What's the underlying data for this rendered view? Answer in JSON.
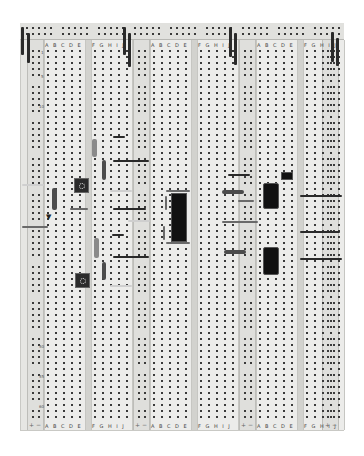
{
  "scene": {
    "description": "Photograph of a solderless breadboard (three terminal-strip sections with power rails) populated with components",
    "colors": {
      "board": "#e6e6e3",
      "hole": "#3a3a3a",
      "wire_dark": "#2a2a2a",
      "wire_light": "#cfcfcf",
      "chip": "#111111"
    }
  },
  "sections": [
    {
      "left_strip_label": "A B C D E",
      "right_strip_label": "F G H I J"
    },
    {
      "left_strip_label": "A B C D E",
      "right_strip_label": "F G H I J"
    },
    {
      "left_strip_label": "A B C D E",
      "right_strip_label": "F G H I J"
    }
  ],
  "row_numbers": [
    "1",
    "5",
    "10",
    "50",
    "55",
    "60"
  ],
  "rail_labels": {
    "plus": "+",
    "minus": "−"
  },
  "components": [
    {
      "type": "trimmer-potentiometer",
      "count": 2
    },
    {
      "type": "dip-ic",
      "count": 1
    },
    {
      "type": "voltage-regulator-or-transistor",
      "count": 2
    },
    {
      "type": "resistor",
      "count": 6
    },
    {
      "type": "diode",
      "count": 1
    },
    {
      "type": "jumper-wire",
      "count": 20
    }
  ]
}
